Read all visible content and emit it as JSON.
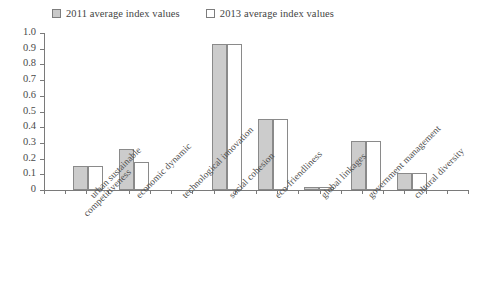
{
  "legend": {
    "entries": [
      {
        "label": "2011 average index values",
        "swatch": "filled-gray-square",
        "color": "#cccccc"
      },
      {
        "label": "2013 average index values",
        "swatch": "hollow-white-square",
        "color": "#ffffff"
      }
    ]
  },
  "axis": {
    "y_ticks": [
      "1.0",
      "0.9",
      "0.8",
      "0.7",
      "0.6",
      "0.5",
      "0.4",
      "0.3",
      "0.2",
      "0.1",
      "0"
    ]
  },
  "chart_data": {
    "type": "bar",
    "title": "",
    "xlabel": "",
    "ylabel": "",
    "ylim": [
      0,
      1.0
    ],
    "ytick_step": 0.1,
    "grid": false,
    "legend_position": "top-left",
    "categories": [
      "urban sustainable competitiveness",
      "economic dynamic",
      "technological innovation",
      "social cohesion",
      "eco-friendliness",
      "global linkages",
      "government management",
      "cultural diversity"
    ],
    "category_lines": [
      [
        "urban sustainable",
        "competitiveness"
      ],
      [
        "economic dynamic"
      ],
      [
        "technological innovation"
      ],
      [
        "social cohesion"
      ],
      [
        "eco-friendliness"
      ],
      [
        "global linkages"
      ],
      [
        "government management"
      ],
      [
        "cultural diversity"
      ]
    ],
    "series": [
      {
        "name": "2011 average index values",
        "color": "#cccccc",
        "values": [
          0.15,
          0.26,
          0.0,
          0.93,
          0.455,
          0.02,
          0.31,
          0.11
        ]
      },
      {
        "name": "2013 average index values",
        "color": "#ffffff",
        "values": [
          0.15,
          0.18,
          0.0,
          0.93,
          0.455,
          0.02,
          0.31,
          0.11
        ]
      }
    ]
  }
}
